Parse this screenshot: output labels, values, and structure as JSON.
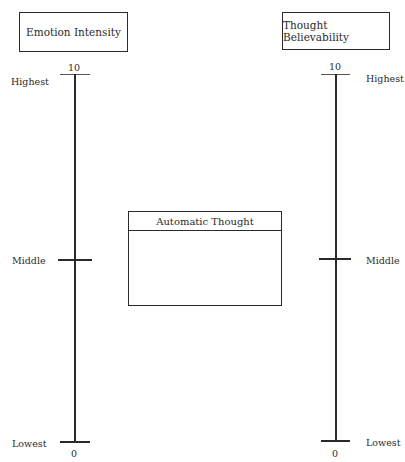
{
  "diagram": {
    "left_scale": {
      "title": "Emotion Intensity",
      "max_value": "10",
      "min_value": "0",
      "labels": {
        "top": "Highest",
        "middle": "Middle",
        "bottom": "Lowest"
      }
    },
    "right_scale": {
      "title": "Thought Believability",
      "max_value": "10",
      "min_value": "0",
      "labels": {
        "top": "Highest",
        "middle": "Middle",
        "bottom": "Lowest"
      }
    },
    "center_box": {
      "title": "Automatic Thought",
      "content": ""
    },
    "colors": {
      "line": "#2a2a2a",
      "background": "#ffffff"
    }
  }
}
